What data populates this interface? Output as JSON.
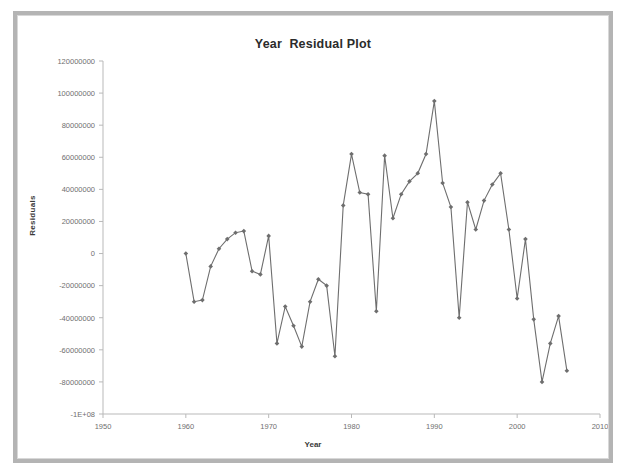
{
  "chart_data": {
    "type": "line",
    "title": "Year  Residual Plot",
    "xlabel": "Year",
    "ylabel": "Residuals",
    "xlim": [
      1950,
      2010
    ],
    "ylim": [
      -100000000,
      120000000
    ],
    "xticks": [
      1950,
      1960,
      1970,
      1980,
      1990,
      2000,
      2010
    ],
    "xticklabels": [
      "1950",
      "1960",
      "1970",
      "1980",
      "1990",
      "2000",
      "2010"
    ],
    "yticks": [
      -100000000,
      -80000000,
      -60000000,
      -40000000,
      -20000000,
      0,
      20000000,
      40000000,
      60000000,
      80000000,
      100000000,
      120000000
    ],
    "yticklabels": [
      "-1E+08",
      "-80000000",
      "-60000000",
      "-40000000",
      "-20000000",
      "0",
      "20000000",
      "40000000",
      "60000000",
      "80000000",
      "100000000",
      "120000000"
    ],
    "grid": false,
    "legend": false,
    "marker": "diamond",
    "series_color": "#6e6e6e",
    "series": [
      {
        "name": "Residuals",
        "x": [
          1960,
          1961,
          1962,
          1963,
          1964,
          1965,
          1966,
          1967,
          1968,
          1969,
          1970,
          1971,
          1972,
          1973,
          1974,
          1975,
          1976,
          1977,
          1978,
          1979,
          1980,
          1981,
          1982,
          1983,
          1984,
          1985,
          1986,
          1987,
          1988,
          1989,
          1990,
          1991,
          1992,
          1993,
          1994,
          1995,
          1996,
          1997,
          1998,
          1999,
          2000,
          2001,
          2002,
          2003,
          2004,
          2005,
          2006
        ],
        "values": [
          0,
          -30000000,
          -29000000,
          -8000000,
          3000000,
          9000000,
          13000000,
          14000000,
          -11000000,
          -13000000,
          11000000,
          -56000000,
          -33000000,
          -45000000,
          -58000000,
          -30000000,
          -16000000,
          -20000000,
          -64000000,
          30000000,
          62000000,
          38000000,
          37000000,
          -36000000,
          61000000,
          22000000,
          37000000,
          45000000,
          50000000,
          62000000,
          95000000,
          44000000,
          29000000,
          -40000000,
          32000000,
          15000000,
          33000000,
          43000000,
          50000000,
          15000000,
          -28000000,
          9000000,
          -41000000,
          -80000000,
          -56000000,
          -39000000,
          -73000000
        ]
      }
    ]
  }
}
